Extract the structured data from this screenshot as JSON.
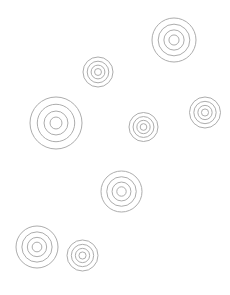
{
  "canvas": {
    "width": 230,
    "height": 295,
    "background_color": "#ffffff",
    "stroke_color": "#a3a3a3",
    "stroke_width": 0.9,
    "title": "Concentric Ring Targets"
  },
  "chart_data": {
    "type": "scatter",
    "title": "",
    "subtitle": "",
    "xlabel": "",
    "ylabel": "",
    "xlim": [
      0,
      230
    ],
    "ylim": [
      0,
      295
    ],
    "grid": false,
    "legend": null,
    "annotations": [],
    "marker_style": "concentric-rings",
    "ring_count_per_marker": 4,
    "ring_radius_fractions": [
      1.0,
      0.72,
      0.46,
      0.23
    ],
    "count": 9,
    "x": [
      174,
      98,
      56,
      143.5,
      205,
      121.5,
      37,
      82.5,
      0
    ],
    "y": [
      40,
      72,
      123,
      127,
      112.5,
      191.5,
      247,
      255.5,
      0
    ],
    "sizes": [
      44,
      30,
      52,
      29,
      31,
      41,
      42,
      31,
      0
    ],
    "points": [
      {
        "id": "target-1",
        "label": "top-right",
        "cx": 174,
        "cy": 40,
        "r": 22,
        "rings": 4
      },
      {
        "id": "target-2",
        "label": "top-middle",
        "cx": 98,
        "cy": 72,
        "r": 15,
        "rings": 4
      },
      {
        "id": "target-3",
        "label": "left-large",
        "cx": 56,
        "cy": 123,
        "r": 26,
        "rings": 4
      },
      {
        "id": "target-4",
        "label": "center",
        "cx": 143.5,
        "cy": 127,
        "r": 14.5,
        "rings": 4
      },
      {
        "id": "target-5",
        "label": "right-edge",
        "cx": 205,
        "cy": 112.5,
        "r": 15.5,
        "rings": 4
      },
      {
        "id": "target-6",
        "label": "center-bottom",
        "cx": 121.5,
        "cy": 191.5,
        "r": 20.5,
        "rings": 4
      },
      {
        "id": "target-7",
        "label": "bottom-left",
        "cx": 37,
        "cy": 247,
        "r": 21,
        "rings": 4
      },
      {
        "id": "target-8",
        "label": "bottom-middle",
        "cx": 82.5,
        "cy": 255.5,
        "r": 15.5,
        "rings": 4
      }
    ]
  }
}
